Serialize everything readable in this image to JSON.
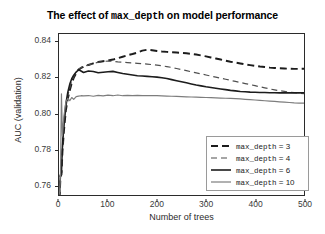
{
  "chart_data": {
    "type": "line",
    "title": "The effect of max_depth on model performance",
    "title_prefix": "The effect of ",
    "title_code": "max_depth",
    "title_suffix": " on model performance",
    "xlabel": "Number of trees",
    "ylabel": "AUC (validation)",
    "xlim": [
      0,
      500
    ],
    "ylim": [
      0.7545,
      0.8445
    ],
    "xticks": [
      0,
      100,
      200,
      300,
      400,
      500
    ],
    "yticks": [
      0.76,
      0.78,
      0.8,
      0.82,
      0.84
    ],
    "ytick_labels": [
      "0.76",
      "0.78",
      "0.80",
      "0.82",
      "0.84"
    ],
    "xtick_labels": [
      "0",
      "100",
      "200",
      "300",
      "400",
      "500"
    ],
    "grid": false,
    "legend_position": "lower-right-inside",
    "x": [
      1,
      3,
      5,
      7,
      10,
      14,
      18,
      22,
      26,
      30,
      35,
      40,
      45,
      50,
      60,
      70,
      80,
      90,
      100,
      110,
      120,
      130,
      140,
      150,
      160,
      170,
      180,
      190,
      200,
      210,
      220,
      230,
      240,
      250,
      260,
      270,
      280,
      290,
      300,
      310,
      320,
      330,
      340,
      350,
      360,
      370,
      380,
      390,
      400,
      410,
      420,
      430,
      440,
      450,
      460,
      470,
      480,
      490,
      500
    ],
    "series": [
      {
        "name": "max_depth = 3",
        "label": "max_depth = 3",
        "depth": 3,
        "style": "dashed-thick",
        "color": "#1c1c1c",
        "width": 2.0,
        "dash": "7,4",
        "values": [
          0.7525,
          0.765,
          0.766,
          0.779,
          0.7905,
          0.802,
          0.8085,
          0.813,
          0.817,
          0.82,
          0.8225,
          0.8245,
          0.8255,
          0.8262,
          0.8272,
          0.8281,
          0.8288,
          0.8293,
          0.8296,
          0.8302,
          0.831,
          0.8318,
          0.8326,
          0.8333,
          0.8341,
          0.8352,
          0.8357,
          0.8354,
          0.835,
          0.8347,
          0.8345,
          0.8343,
          0.8341,
          0.8339,
          0.8337,
          0.8334,
          0.833,
          0.8325,
          0.832,
          0.8314,
          0.8308,
          0.8302,
          0.8296,
          0.829,
          0.8285,
          0.828,
          0.8275,
          0.8271,
          0.8267,
          0.8263,
          0.826,
          0.8257,
          0.8255,
          0.8253,
          0.8252,
          0.8251,
          0.825,
          0.825,
          0.8251
        ]
      },
      {
        "name": "max_depth = 4",
        "label": "max_depth = 4",
        "depth": 4,
        "style": "dashed-thin",
        "color": "#4f4f4f",
        "width": 1.2,
        "dash": "6,4",
        "values": [
          0.754,
          0.7655,
          0.7665,
          0.78,
          0.792,
          0.8035,
          0.81,
          0.8145,
          0.818,
          0.8208,
          0.8232,
          0.825,
          0.8258,
          0.8264,
          0.8272,
          0.828,
          0.8287,
          0.8291,
          0.8294,
          0.8292,
          0.8289,
          0.8287,
          0.8285,
          0.8283,
          0.8281,
          0.8279,
          0.8277,
          0.8274,
          0.8271,
          0.8267,
          0.8263,
          0.8258,
          0.8252,
          0.8246,
          0.824,
          0.8234,
          0.8228,
          0.8222,
          0.8216,
          0.821,
          0.8204,
          0.8198,
          0.8192,
          0.8186,
          0.818,
          0.8174,
          0.8168,
          0.8162,
          0.8156,
          0.815,
          0.8144,
          0.8138,
          0.8133,
          0.8128,
          0.8124,
          0.812,
          0.8117,
          0.8114,
          0.8112
        ]
      },
      {
        "name": "max_depth = 6",
        "label": "max_depth = 6",
        "depth": 6,
        "style": "solid-thick",
        "color": "#1c1c1c",
        "width": 1.6,
        "dash": "none",
        "values": [
          0.755,
          0.7658,
          0.767,
          0.782,
          0.794,
          0.8055,
          0.812,
          0.8165,
          0.8195,
          0.8215,
          0.8232,
          0.8245,
          0.8238,
          0.823,
          0.8238,
          0.8235,
          0.8228,
          0.8231,
          0.8234,
          0.8236,
          0.823,
          0.8224,
          0.822,
          0.8216,
          0.8212,
          0.821,
          0.8208,
          0.8206,
          0.8204,
          0.82,
          0.8196,
          0.819,
          0.8184,
          0.8178,
          0.8172,
          0.8166,
          0.816,
          0.8155,
          0.815,
          0.8146,
          0.8142,
          0.8138,
          0.8134,
          0.813,
          0.8127,
          0.8124,
          0.8122,
          0.812,
          0.8119,
          0.8118,
          0.8118,
          0.8117,
          0.8117,
          0.8116,
          0.8116,
          0.8116,
          0.8116,
          0.8116,
          0.8117
        ]
      },
      {
        "name": "max_depth = 10",
        "label": "max_depth = 10",
        "depth": 10,
        "style": "solid-thin",
        "color": "#7d7d7d",
        "width": 1.2,
        "dash": "none",
        "values": [
          0.7548,
          0.766,
          0.811,
          0.7875,
          0.7985,
          0.8065,
          0.8085,
          0.8072,
          0.809,
          0.808,
          0.8095,
          0.8098,
          0.81,
          0.8099,
          0.8101,
          0.8097,
          0.8102,
          0.8099,
          0.8103,
          0.81,
          0.8104,
          0.81,
          0.8102,
          0.8101,
          0.8102,
          0.8101,
          0.8101,
          0.81,
          0.81,
          0.8099,
          0.8098,
          0.8097,
          0.8096,
          0.8095,
          0.8094,
          0.8093,
          0.8092,
          0.8091,
          0.809,
          0.8089,
          0.8088,
          0.8087,
          0.8086,
          0.8085,
          0.8084,
          0.8082,
          0.808,
          0.8078,
          0.8076,
          0.8074,
          0.8072,
          0.807,
          0.8068,
          0.8066,
          0.8064,
          0.8062,
          0.806,
          0.8059,
          0.8059
        ]
      }
    ]
  }
}
